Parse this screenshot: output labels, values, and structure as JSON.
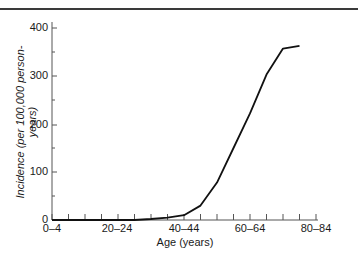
{
  "chart_data": {
    "type": "line",
    "title": "",
    "xlabel": "Age (years)",
    "ylabel": "Incidence (per 100,000 person-years)",
    "ylim": [
      0,
      400
    ],
    "yticks": [
      0,
      100,
      200,
      300,
      400
    ],
    "xtick_labels": [
      "0–4",
      "20–24",
      "40–44",
      "60–64",
      "80–84"
    ],
    "categories": [
      "0–4",
      "5–9",
      "10–14",
      "15–19",
      "20–24",
      "25–29",
      "30–34",
      "35–39",
      "40–44",
      "45–49",
      "50–54",
      "55–59",
      "60–64",
      "65–69",
      "70–74",
      "75–79",
      "80–84"
    ],
    "series": [
      {
        "name": "Incidence",
        "values": [
          0,
          0,
          0,
          0,
          0,
          0,
          2,
          5,
          10,
          30,
          78,
          150,
          222,
          303,
          357,
          363,
          null
        ]
      }
    ],
    "grid": false,
    "legend": null
  },
  "axes": {
    "y_tick_labels": [
      "400",
      "300",
      "200",
      "100",
      "0"
    ],
    "x_tick_labels": [
      "0–4",
      "20–24",
      "40–44",
      "60–64",
      "80–84"
    ],
    "x_title": "Age (years)",
    "y_title": "Incidence (per 100,000 person-years)"
  }
}
